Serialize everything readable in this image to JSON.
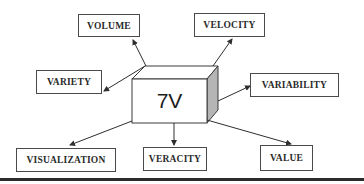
{
  "diagram": {
    "center": {
      "label": "7V"
    },
    "nodes": [
      {
        "id": "volume",
        "label": "VOLUME"
      },
      {
        "id": "velocity",
        "label": "VELOCITY"
      },
      {
        "id": "variety",
        "label": "VARIETY"
      },
      {
        "id": "variability",
        "label": "VARIABILITY"
      },
      {
        "id": "visualization",
        "label": "VISUALIZATION"
      },
      {
        "id": "veracity",
        "label": "VERACITY"
      },
      {
        "id": "value",
        "label": "VALUE"
      }
    ],
    "edges": [
      {
        "from": "7V",
        "to": "VOLUME"
      },
      {
        "from": "7V",
        "to": "VELOCITY"
      },
      {
        "from": "7V",
        "to": "VARIETY"
      },
      {
        "from": "7V",
        "to": "VARIABILITY"
      },
      {
        "from": "7V",
        "to": "VISUALIZATION"
      },
      {
        "from": "7V",
        "to": "VERACITY"
      },
      {
        "from": "7V",
        "to": "VALUE"
      }
    ],
    "colors": {
      "line": "#2e2e2e",
      "cube_side": "#b5b5b5",
      "box_border": "#4a4a4a"
    }
  }
}
